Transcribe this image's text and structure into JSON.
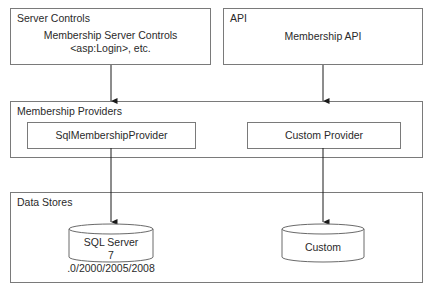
{
  "server_controls": {
    "label": "Server Controls",
    "line1": "Membership Server Controls",
    "line2": "<asp:Login>, etc."
  },
  "api": {
    "label": "API",
    "content": "Membership API"
  },
  "providers": {
    "label": "Membership Providers",
    "sql": "SqlMembershipProvider",
    "custom": "Custom Provider"
  },
  "data_stores": {
    "label": "Data Stores",
    "sql_line1": "SQL Server",
    "sql_line2": "7 .0/2000/2005/2008",
    "custom": "Custom"
  },
  "colors": {
    "line": "#1a1a1a",
    "border": "#7a7a7a"
  }
}
